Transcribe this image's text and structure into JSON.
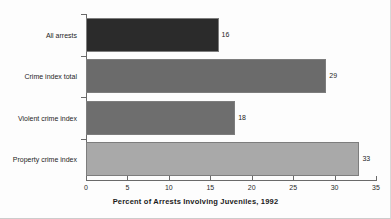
{
  "chart_data": {
    "type": "bar",
    "orientation": "horizontal",
    "title": "",
    "xlabel": "Percent of Arrests Involving Juveniles, 1992",
    "ylabel": "",
    "categories": [
      "All arrests",
      "Crime index total",
      "Violent crime index",
      "Property crime index"
    ],
    "values": [
      16,
      29,
      18,
      33
    ],
    "value_labels": [
      "16",
      "29",
      "18",
      "33"
    ],
    "bar_colors": [
      "#2b2b2b",
      "#6b6b6b",
      "#6e6e6e",
      "#a9a9a9"
    ],
    "xlim": [
      0,
      35
    ],
    "xticks": [
      0,
      5,
      10,
      15,
      20,
      25,
      30,
      35
    ],
    "xtick_labels": [
      "0",
      "5",
      "10",
      "15",
      "20",
      "25",
      "30",
      "35"
    ],
    "grid": false,
    "legend": false
  }
}
